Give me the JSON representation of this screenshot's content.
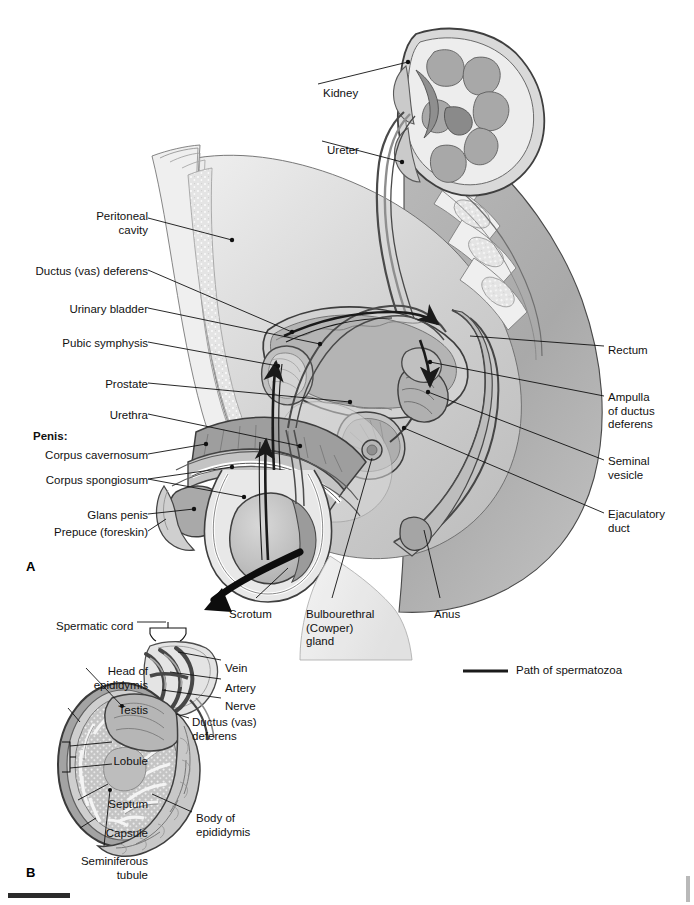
{
  "figure": {
    "panels": [
      {
        "id": "A",
        "label": "A",
        "caption": "Sagittal section of male pelvis"
      },
      {
        "id": "B",
        "label": "B",
        "caption": "Sagittal section of testis and epididymis"
      }
    ]
  },
  "legend": {
    "line_label": "Path of spermatozoa",
    "line_color": "#1a1a1a"
  },
  "colors": {
    "ink": "#111111",
    "outline": "#3a3a3a",
    "tissue_light": "#e9e9e9",
    "tissue_mid": "#c9c9c9",
    "tissue_dark": "#a6a6a6",
    "tissue_darker": "#8d8d8d",
    "organ_gray": "#9a9a9a",
    "white": "#ffffff",
    "path_arrow": "#1a1a1a"
  },
  "panel_a": {
    "labels_left": [
      {
        "name": "peritoneal-cavity",
        "text": "Peritoneal\ncavity",
        "x": 85,
        "y": 210,
        "align": "right",
        "bold": false
      },
      {
        "name": "ductus-vas-deferens",
        "text": "Ductus (vas) deferens",
        "x": 18,
        "y": 265,
        "align": "right",
        "bold": false
      },
      {
        "name": "urinary-bladder",
        "text": "Urinary bladder",
        "x": 57,
        "y": 303,
        "align": "right",
        "bold": false
      },
      {
        "name": "pubic-symphysis",
        "text": "Pubic symphysis",
        "x": 49,
        "y": 337,
        "align": "right",
        "bold": false
      },
      {
        "name": "prostate",
        "text": "Prostate",
        "x": 92,
        "y": 378,
        "align": "right",
        "bold": false
      },
      {
        "name": "urethra",
        "text": "Urethra",
        "x": 99,
        "y": 409,
        "align": "right",
        "bold": false
      },
      {
        "name": "penis-heading",
        "text": "Penis:",
        "x": 33,
        "y": 430,
        "align": "left",
        "bold": true
      },
      {
        "name": "corpus-cavernosum",
        "text": "Corpus cavernosum",
        "x": 26,
        "y": 449,
        "align": "right",
        "bold": false
      },
      {
        "name": "corpus-spongiosum",
        "text": "Corpus spongiosum",
        "x": 26,
        "y": 474,
        "align": "right",
        "bold": false
      },
      {
        "name": "glans-penis",
        "text": "Glans penis",
        "x": 76,
        "y": 509,
        "align": "right",
        "bold": false
      },
      {
        "name": "prepuce-foreskin",
        "text": "Prepuce (foreskin)",
        "x": 32,
        "y": 526,
        "align": "right",
        "bold": false
      }
    ],
    "labels_right": [
      {
        "name": "kidney",
        "text": "Kidney",
        "x": 323,
        "y": 87,
        "align": "left",
        "bold": false
      },
      {
        "name": "ureter",
        "text": "Ureter",
        "x": 327,
        "y": 144,
        "align": "left",
        "bold": false
      },
      {
        "name": "rectum",
        "text": "Rectum",
        "x": 608,
        "y": 344,
        "align": "left",
        "bold": false
      },
      {
        "name": "ampulla-of-ductus-deferens",
        "text": "Ampulla\nof ductus\ndeferens",
        "x": 608,
        "y": 391,
        "align": "left",
        "bold": false
      },
      {
        "name": "seminal-vesicle",
        "text": "Seminal\nvesicle",
        "x": 608,
        "y": 455,
        "align": "left",
        "bold": false
      },
      {
        "name": "ejaculatory-duct",
        "text": "Ejaculatory\nduct",
        "x": 608,
        "y": 508,
        "align": "left",
        "bold": false
      }
    ],
    "labels_bottom": [
      {
        "name": "scrotum",
        "text": "Scrotum",
        "x": 229,
        "y": 608,
        "align": "left",
        "bold": false
      },
      {
        "name": "bulbourethral-cowper-gland",
        "text": "Bulbourethral\n(Cowper)\ngland",
        "x": 306,
        "y": 608,
        "align": "left",
        "bold": false
      },
      {
        "name": "anus",
        "text": "Anus",
        "x": 434,
        "y": 608,
        "align": "left",
        "bold": false
      }
    ],
    "panel_letter": {
      "text": "A",
      "x": 26,
      "y": 566
    }
  },
  "panel_b": {
    "labels_left": [
      {
        "name": "spermatic-cord",
        "text": "Spermatic cord",
        "x": 56,
        "y": 620,
        "align": "left",
        "bold": false
      },
      {
        "name": "head-of-epididymis",
        "text": "Head of\nepididymis",
        "x": 35,
        "y": 665,
        "align": "right",
        "bold": false
      },
      {
        "name": "testis",
        "text": "Testis",
        "x": 22,
        "y": 704,
        "align": "right",
        "bold": false
      },
      {
        "name": "lobule",
        "text": "Lobule",
        "x": 21,
        "y": 755,
        "align": "right",
        "bold": false
      },
      {
        "name": "septum",
        "text": "Septum",
        "x": 23,
        "y": 798,
        "align": "right",
        "bold": false
      },
      {
        "name": "capsule",
        "text": "Capsule",
        "x": 25,
        "y": 827,
        "align": "right",
        "bold": false
      },
      {
        "name": "seminiferous-tubule",
        "text": "Seminiferous\ntubule",
        "x": 30,
        "y": 855,
        "align": "right",
        "bold": false
      }
    ],
    "labels_right": [
      {
        "name": "vein",
        "text": "Vein",
        "x": 225,
        "y": 662,
        "align": "left",
        "bold": false
      },
      {
        "name": "artery",
        "text": "Artery",
        "x": 225,
        "y": 682,
        "align": "left",
        "bold": false
      },
      {
        "name": "nerve",
        "text": "Nerve",
        "x": 225,
        "y": 700,
        "align": "left",
        "bold": false
      },
      {
        "name": "ductus-vas-deferens-b",
        "text": "Ductus (vas)\ndeferens",
        "x": 192,
        "y": 716,
        "align": "left",
        "bold": false
      },
      {
        "name": "body-of-epididymis",
        "text": "Body of\nepididymis",
        "x": 196,
        "y": 812,
        "align": "left",
        "bold": false
      }
    ],
    "panel_letter": {
      "text": "B",
      "x": 26,
      "y": 872
    }
  }
}
